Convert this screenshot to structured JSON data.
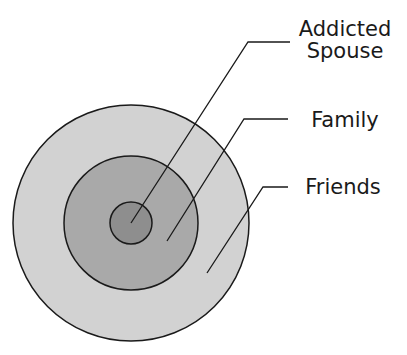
{
  "diagram": {
    "type": "concentric-circles",
    "rings": [
      {
        "id": "friends",
        "label": "Friends",
        "fill": "#d2d2d2",
        "cx": 131,
        "cy": 223,
        "r": 118
      },
      {
        "id": "family",
        "label": "Family",
        "fill": "#a9a9a9",
        "cx": 131,
        "cy": 223,
        "r": 67
      },
      {
        "id": "addicted-spouse",
        "label": "Addicted Spouse",
        "fill": "#8e8e8e",
        "cx": 131,
        "cy": 223,
        "r": 21
      }
    ],
    "labels": {
      "addicted_line1": "Addicted",
      "addicted_line2": "Spouse",
      "family": "Family",
      "friends": "Friends"
    },
    "stroke_color": "#1a1a1a"
  }
}
